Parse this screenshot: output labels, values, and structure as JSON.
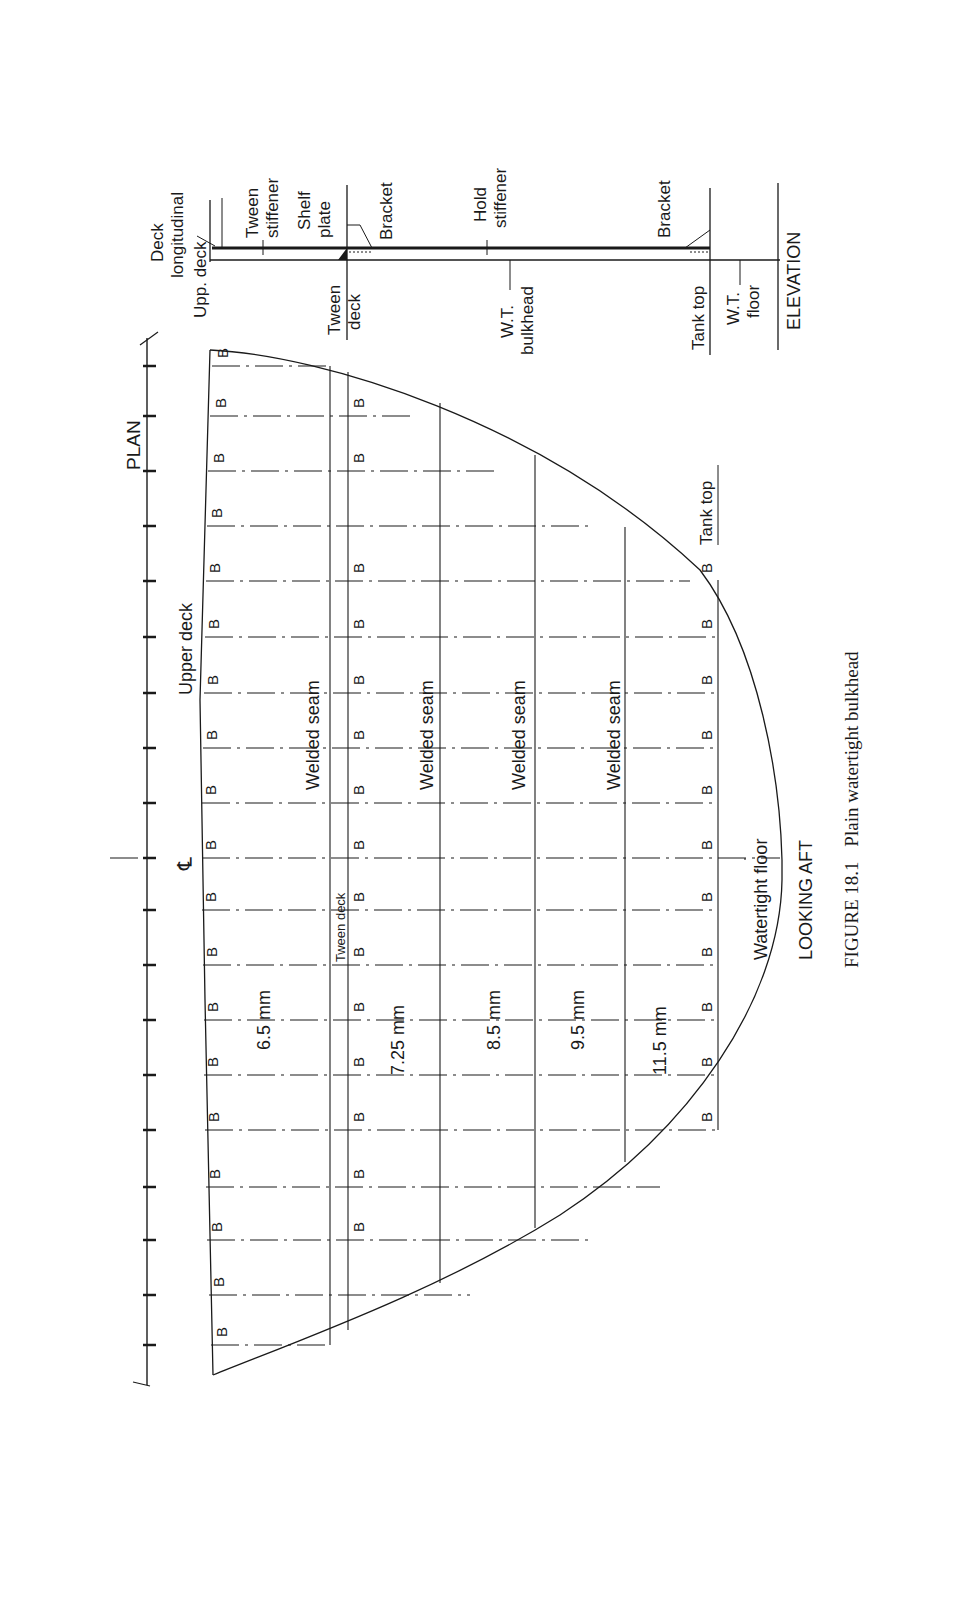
{
  "figure": {
    "caption_prefix": "FIGURE 18.1",
    "caption_text": "Plain watertight bulkhead",
    "orientation": "rotated 90 degrees counter-clockwise"
  },
  "plan": {
    "title": "PLAN",
    "upper_deck_label": "Upper deck",
    "tween_deck_label": "Tween deck",
    "tank_top_label": "Tank top",
    "watertight_floor_label": "Watertight  floor",
    "looking_label": "LOOKING  AFT",
    "centreline_symbol": "℄",
    "bracket_marker": "B",
    "welded_seam_label": "Welded seam",
    "plate_thicknesses": [
      "6.5 mm",
      "7.25 mm",
      "8.5 mm",
      "9.5 mm",
      "11.5 mm"
    ]
  },
  "elevation": {
    "title": "ELEVATION",
    "labels": {
      "deck_longitudinal": [
        "Deck",
        "longitudinal"
      ],
      "upp_deck": "Upp. deck",
      "tween_stiffener": [
        "Tween",
        "stiffener"
      ],
      "shelf_plate": [
        "Shelf",
        "plate"
      ],
      "bracket_upper": "Bracket",
      "tween_deck": [
        "Tween",
        "deck"
      ],
      "hold_stiffener": [
        "Hold",
        "stiffener"
      ],
      "wt_bulkhead": [
        "W.T.",
        "bulkhead"
      ],
      "bracket_lower": "Bracket",
      "tank_top": "Tank top",
      "wt_floor": [
        "W.T.",
        "floor"
      ]
    }
  }
}
